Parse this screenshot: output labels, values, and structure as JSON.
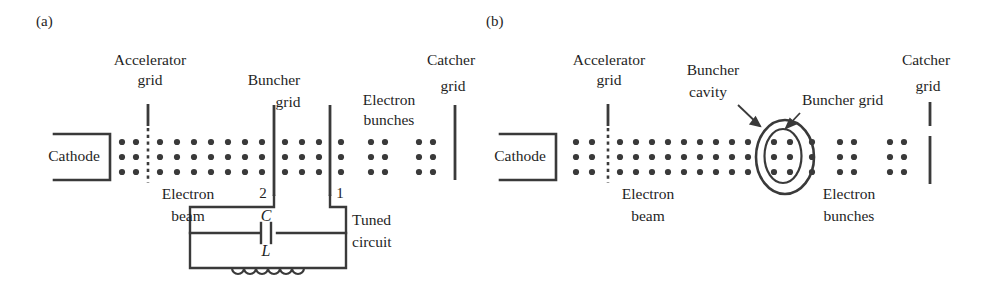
{
  "figure": {
    "type": "two-panel-klystron-schematic",
    "background": "#ffffff",
    "ink": "#333333",
    "dot_color": "#3a3a3a",
    "width": 987,
    "height": 289
  },
  "panel_a": {
    "tag": "(a)",
    "labels": {
      "accelerator_grid_line1": "Accelerator",
      "accelerator_grid_line2": "grid",
      "buncher_grid_line1": "Buncher",
      "buncher_grid_line2": "grid",
      "electron_bunches_line1": "Electron",
      "electron_bunches_line2": "bunches",
      "catcher_grid_line1": "Catcher",
      "catcher_grid_line2": "grid",
      "cathode": "Cathode",
      "electron_beam_line1": "Electron",
      "electron_beam_line2": "beam",
      "grid_number_2": "2",
      "grid_number_1": "1",
      "capacitor": "C",
      "inductor": "L",
      "tuned_circuit_line1": "Tuned",
      "tuned_circuit_line2": "circuit"
    },
    "beam": {
      "rows": 3,
      "pre_accelerator_columns": 2,
      "mid_columns": 7,
      "between_buncher_columns": 3,
      "bunch_count": 2,
      "bunch_columns_each": 2
    },
    "tuned_circuit": {
      "components": [
        "C",
        "L"
      ],
      "inductor_coils": 7
    }
  },
  "panel_b": {
    "tag": "(b)",
    "labels": {
      "accelerator_grid_line1": "Accelerator",
      "accelerator_grid_line2": "grid",
      "buncher_cavity_line1": "Buncher",
      "buncher_cavity_line2": "cavity",
      "buncher_grid": "Buncher grid",
      "catcher_grid_line1": "Catcher",
      "catcher_grid_line2": "grid",
      "cathode": "Cathode",
      "electron_beam_line1": "Electron",
      "electron_beam_line2": "beam",
      "electron_bunches_line1": "Electron",
      "electron_bunches_line2": "bunches"
    },
    "beam": {
      "rows": 3,
      "pre_accelerator_columns": 2,
      "mid_columns": 10,
      "cavity_columns": 2,
      "bunch_count": 2,
      "bunch_columns_each": 2
    },
    "cavity": {
      "shape": "double-oval",
      "outer_rx": 28,
      "outer_ry": 36,
      "inner_rx": 18,
      "inner_ry": 27
    }
  }
}
